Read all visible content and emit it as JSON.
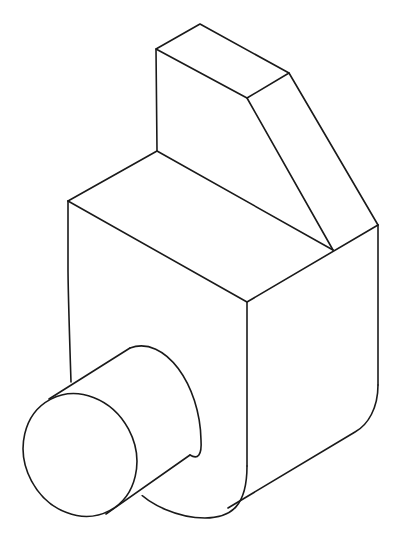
{
  "figure": {
    "type": "isometric line drawing",
    "line_color": "#1a1a1a",
    "background_color": "#ffffff",
    "parts": [
      {
        "name": "upright-block",
        "description": "rear vertical block with chamfered slope face"
      },
      {
        "name": "base-block",
        "description": "main lower block with rounded bottom edges"
      },
      {
        "name": "cylinder-boss",
        "description": "cylindrical projection on front-left face"
      }
    ]
  }
}
